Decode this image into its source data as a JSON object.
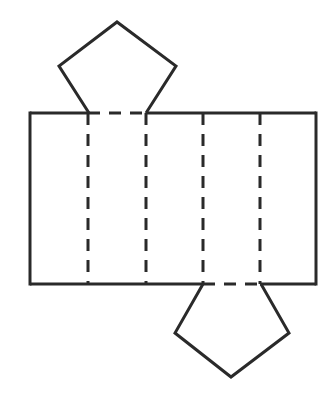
{
  "diagram": {
    "type": "net-of-pentagonal-prism",
    "colors": {
      "stroke": "#2a2a2a",
      "background": "#ffffff"
    },
    "rectangle": {
      "x": 30,
      "y": 113,
      "width": 286,
      "height": 171
    },
    "fold_lines_x": [
      88,
      146,
      203,
      260
    ],
    "top_pentagon": [
      [
        117,
        22
      ],
      [
        176,
        66
      ],
      [
        146,
        113
      ],
      [
        89,
        113
      ],
      [
        59,
        66
      ]
    ],
    "bottom_pentagon": [
      [
        203,
        284
      ],
      [
        261,
        284
      ],
      [
        289,
        333
      ],
      [
        231,
        377
      ],
      [
        175,
        333
      ]
    ]
  }
}
